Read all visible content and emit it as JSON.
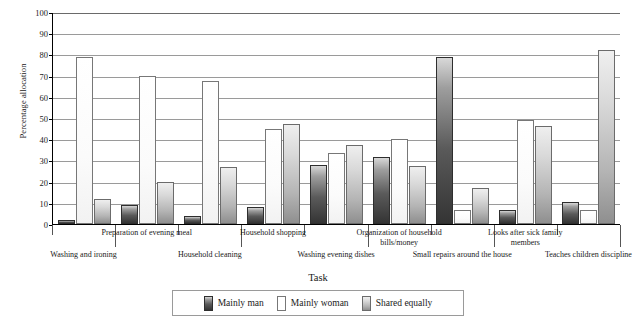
{
  "chart_data": {
    "type": "bar",
    "title": "",
    "xlabel": "Task",
    "ylabel": "Percentage allocation",
    "ylim": [
      0,
      100
    ],
    "ytick_step": 10,
    "yticks": [
      0,
      10,
      20,
      30,
      40,
      50,
      60,
      70,
      80,
      90,
      100
    ],
    "grid": "horizontal",
    "legend_position": "bottom",
    "categories": [
      "Washing and ironing",
      "Preparation of evening meal",
      "Household cleaning",
      "Household shopping",
      "Washing evening dishes",
      "Organization of household bills/money",
      "Small repairs around the house",
      "Looks after sick family members",
      "Teaches children discipline"
    ],
    "series": [
      {
        "name": "Mainly man",
        "color": "#343434",
        "values": [
          2,
          9,
          4,
          8,
          28,
          31.5,
          79,
          6.5,
          10.5
        ]
      },
      {
        "name": "Mainly woman",
        "color": "#ffffff",
        "values": [
          79,
          70,
          67.5,
          45,
          33.5,
          40,
          6.5,
          49,
          6.5
        ]
      },
      {
        "name": "Shared equally",
        "color": "#b4b4b4",
        "values": [
          12,
          20,
          27,
          47,
          37.5,
          27.5,
          17,
          46,
          82
        ]
      }
    ]
  },
  "axis": {
    "y_title": "Percentage allocation",
    "x_title": "Task",
    "y_ticks": [
      "0",
      "10",
      "20",
      "30",
      "40",
      "50",
      "60",
      "70",
      "80",
      "90",
      "100"
    ]
  },
  "x_labels": [
    {
      "text": "Washing and ironing",
      "row": 2
    },
    {
      "text": "Preparation of evening meal",
      "row": 1
    },
    {
      "text": "Household cleaning",
      "row": 2
    },
    {
      "text": "Household shopping",
      "row": 1
    },
    {
      "text": "Washing evening dishes",
      "row": 2
    },
    {
      "text": "Organization of household bills/money",
      "row": 1
    },
    {
      "text": "Small repairs around the house",
      "row": 2
    },
    {
      "text": "Looks after sick family members",
      "row": 1
    },
    {
      "text": "Teaches children discipline",
      "row": 2
    }
  ],
  "legend": {
    "items": [
      {
        "label": "Mainly man",
        "swatch": "man"
      },
      {
        "label": "Mainly woman",
        "swatch": "woman"
      },
      {
        "label": "Shared equally",
        "swatch": "shared"
      }
    ]
  }
}
